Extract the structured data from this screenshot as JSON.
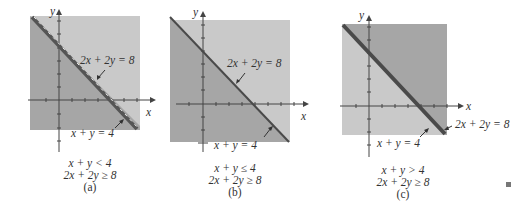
{
  "figure": {
    "panels": [
      {
        "id": "a",
        "caption": "(a)",
        "inequality_1": "x + y < 4",
        "inequality_2": "2x + 2y ≥ 8",
        "line_labels": {
          "top": "2x + 2y = 8",
          "bottom": "x + y = 4"
        },
        "axis_labels": {
          "x": "x",
          "y": "y"
        },
        "boundary_style": "dashed"
      },
      {
        "id": "b",
        "caption": "(b)",
        "inequality_1": "x + y ≤ 4",
        "inequality_2": "2x + 2y ≥ 8",
        "line_labels": {
          "top": "2x + 2y = 8",
          "bottom": "x + y = 4"
        },
        "axis_labels": {
          "x": "x",
          "y": "y"
        },
        "boundary_style": "solid"
      },
      {
        "id": "c",
        "caption": "(c)",
        "inequality_1": "x + y > 4",
        "inequality_2": "2x + 2y ≥ 8",
        "line_labels": {
          "right": "2x + 2y = 8",
          "bottom": "x + y = 4"
        },
        "axis_labels": {
          "x": "x",
          "y": "y"
        },
        "boundary_style": "solid-thick"
      }
    ],
    "colors": {
      "light_region": "#c9c9c9",
      "dark_region": "#a3a3a3",
      "line": "#555555",
      "axis": "#444444"
    }
  }
}
